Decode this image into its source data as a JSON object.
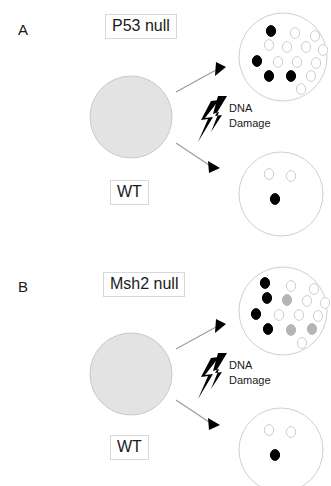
{
  "figure": {
    "background_color": "#ffffff",
    "width": 331,
    "height": 486
  },
  "colors": {
    "big_circle_fill": "#e3e3e3",
    "big_circle_stroke": "#c9c9c9",
    "small_circle_stroke": "#cfcfcf",
    "cell_black": "#000000",
    "cell_gray": "#b5b5b5",
    "cell_white": "#ffffff",
    "arrow_line": "#9a9a9a",
    "arrow_head": "#000000",
    "bolt": "#000000",
    "label_border": "#d8d8d8",
    "text": "#1a1a1a"
  },
  "panels": [
    {
      "id": "A",
      "panel_label": "A",
      "mutant_label": "P53 null",
      "wildtype_label": "WT",
      "damage_line1": "DNA",
      "damage_line2": "Damage",
      "mutant_outcome": {
        "name": "p53-null-outcome-circle",
        "cells": [
          {
            "cx": 32,
            "cy": 18,
            "state": "black"
          },
          {
            "cx": 56,
            "cy": 20,
            "state": "white"
          },
          {
            "cx": 76,
            "cy": 23,
            "state": "white"
          },
          {
            "cx": 30,
            "cy": 32,
            "state": "white"
          },
          {
            "cx": 48,
            "cy": 34,
            "state": "white"
          },
          {
            "cx": 67,
            "cy": 34,
            "state": "white"
          },
          {
            "cx": 84,
            "cy": 37,
            "state": "white"
          },
          {
            "cx": 18,
            "cy": 48,
            "state": "black"
          },
          {
            "cx": 39,
            "cy": 49,
            "state": "white"
          },
          {
            "cx": 58,
            "cy": 49,
            "state": "white"
          },
          {
            "cx": 77,
            "cy": 50,
            "state": "white"
          },
          {
            "cx": 30,
            "cy": 63,
            "state": "black"
          },
          {
            "cx": 52,
            "cy": 63,
            "state": "black"
          },
          {
            "cx": 72,
            "cy": 63,
            "state": "white"
          },
          {
            "cx": 62,
            "cy": 76,
            "state": "white"
          }
        ]
      },
      "wildtype_outcome": {
        "name": "wt-outcome-circle",
        "cells": [
          {
            "cx": 30,
            "cy": 22,
            "state": "white"
          },
          {
            "cx": 52,
            "cy": 24,
            "state": "white"
          },
          {
            "cx": 36,
            "cy": 47,
            "state": "black"
          }
        ]
      }
    },
    {
      "id": "B",
      "panel_label": "B",
      "mutant_label": "Msh2 null",
      "wildtype_label": "WT",
      "damage_line1": "DNA",
      "damage_line2": "Damage",
      "mutant_outcome": {
        "name": "msh2-null-outcome-circle",
        "cells": [
          {
            "cx": 26,
            "cy": 16,
            "state": "black"
          },
          {
            "cx": 52,
            "cy": 19,
            "state": "white"
          },
          {
            "cx": 75,
            "cy": 22,
            "state": "white"
          },
          {
            "cx": 28,
            "cy": 31,
            "state": "black"
          },
          {
            "cx": 48,
            "cy": 33,
            "state": "gray"
          },
          {
            "cx": 68,
            "cy": 34,
            "state": "white"
          },
          {
            "cx": 86,
            "cy": 36,
            "state": "white"
          },
          {
            "cx": 17,
            "cy": 47,
            "state": "black"
          },
          {
            "cx": 40,
            "cy": 48,
            "state": "white"
          },
          {
            "cx": 60,
            "cy": 48,
            "state": "white"
          },
          {
            "cx": 79,
            "cy": 49,
            "state": "white"
          },
          {
            "cx": 29,
            "cy": 62,
            "state": "black"
          },
          {
            "cx": 52,
            "cy": 63,
            "state": "gray"
          },
          {
            "cx": 73,
            "cy": 62,
            "state": "gray"
          },
          {
            "cx": 63,
            "cy": 76,
            "state": "white"
          }
        ]
      },
      "wildtype_outcome": {
        "name": "wt-outcome-circle",
        "cells": [
          {
            "cx": 30,
            "cy": 22,
            "state": "white"
          },
          {
            "cx": 52,
            "cy": 24,
            "state": "white"
          },
          {
            "cx": 36,
            "cy": 47,
            "state": "black"
          }
        ]
      }
    }
  ]
}
